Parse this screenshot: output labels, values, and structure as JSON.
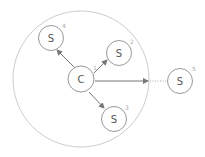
{
  "diagram": {
    "colors": {
      "outer_circle": "#cccccc",
      "node_stroke": "#999999",
      "arrow": "#777777",
      "text": "#555555",
      "index": "#aaaaaa"
    },
    "range_circle": {
      "cx": 81,
      "cy": 79,
      "r": 68
    },
    "center_node": {
      "label": "C",
      "index": "1",
      "cx": 81,
      "cy": 79
    },
    "servers": [
      {
        "label": "S",
        "index": "4",
        "cx": 51,
        "cy": 38
      },
      {
        "label": "S",
        "index": "2",
        "cx": 119,
        "cy": 53
      },
      {
        "label": "S",
        "index": "3",
        "cx": 114,
        "cy": 119
      },
      {
        "label": "S",
        "index": "5",
        "cx": 180,
        "cy": 81
      }
    ],
    "edges": [
      {
        "from": "C",
        "to": "S4",
        "style": "solid"
      },
      {
        "from": "C",
        "to": "S2",
        "style": "solid"
      },
      {
        "from": "C",
        "to": "S3",
        "style": "solid"
      },
      {
        "from": "C",
        "to": "range-boundary",
        "style": "solid"
      },
      {
        "from": "range-boundary",
        "to": "S5",
        "style": "dotted"
      }
    ]
  }
}
